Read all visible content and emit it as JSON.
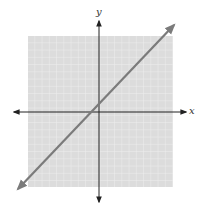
{
  "figure": {
    "type": "coordinate-plane",
    "axes": {
      "x_label": "x",
      "y_label": "y"
    },
    "grid": {
      "cells_x": 20,
      "cells_y": 21,
      "color": "#d9d9d9",
      "line_color": "#f4f4f4"
    },
    "line": {
      "description": "straight line with positive slope (~1) and arrows at both ends, crossing y-axis just above origin",
      "color": "#7a7a7a",
      "slope": 1,
      "y_intercept_cells": 1
    },
    "colors": {
      "axis": "#222222",
      "grid_bg": "#dcdcdc",
      "line": "#7b7b7b"
    }
  }
}
